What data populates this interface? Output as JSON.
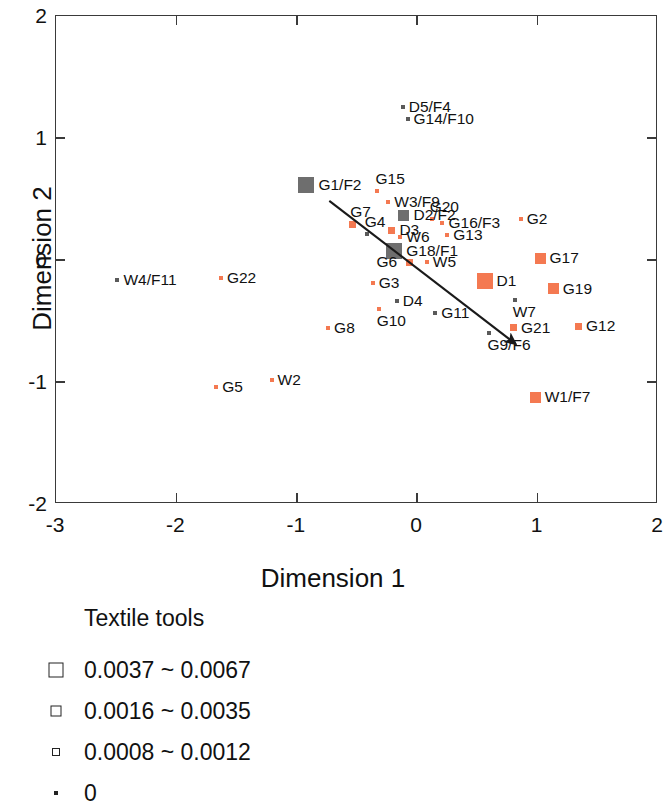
{
  "chart_data": {
    "type": "scatter",
    "title": "",
    "xlabel": "Dimension 1",
    "ylabel": "Dimension 2",
    "xlim": [
      -3,
      2
    ],
    "ylim": [
      -2,
      2
    ],
    "xticks": [
      "-3",
      "-2",
      "-1",
      "0",
      "1",
      "2"
    ],
    "xtick_values": [
      -3,
      -2,
      -1,
      0,
      1,
      2
    ],
    "yticks": [
      "2",
      "1",
      "0",
      "-1",
      "-2"
    ],
    "ytick_values": [
      2,
      1,
      0,
      -1,
      -2
    ],
    "grid": false,
    "legend_position": "below-plot-left",
    "colors": {
      "orange": "#f47951",
      "gray": "#6e6e6e",
      "dark": "#5a5a5a",
      "axis": "#3a3a3a",
      "text": "#111111"
    },
    "size_classes": {
      "large": 16,
      "medium": 11,
      "small": 7,
      "tiny": 4
    },
    "annotation": {
      "type": "arrow",
      "name": "trend-arrow",
      "x_start": -0.73,
      "y_start": 0.485,
      "x_end": 0.82,
      "y_end": -0.69
    },
    "points": [
      {
        "label": "D5/F4",
        "x": -0.12,
        "y": 1.255,
        "color": "dark",
        "size": "tiny",
        "label_side": "right"
      },
      {
        "label": "G14/F10",
        "x": -0.08,
        "y": 1.155,
        "color": "dark",
        "size": "tiny",
        "label_side": "right"
      },
      {
        "label": "G1/F2",
        "x": -0.92,
        "y": 0.615,
        "color": "gray",
        "size": "large",
        "label_side": "right"
      },
      {
        "label": "G15",
        "x": -0.33,
        "y": 0.565,
        "color": "orange",
        "size": "tiny",
        "label_side": "above-right"
      },
      {
        "label": "W3/F9",
        "x": -0.24,
        "y": 0.475,
        "color": "orange",
        "size": "tiny",
        "label_side": "right"
      },
      {
        "label": "G20",
        "x": 0.12,
        "y": 0.335,
        "color": "orange",
        "size": "tiny",
        "label_side": "above-right"
      },
      {
        "label": "D2/F2",
        "x": -0.11,
        "y": 0.365,
        "color": "gray",
        "size": "medium",
        "label_side": "right"
      },
      {
        "label": "G16/F3",
        "x": 0.21,
        "y": 0.305,
        "color": "orange",
        "size": "tiny",
        "label_side": "right"
      },
      {
        "label": "G2",
        "x": 0.86,
        "y": 0.335,
        "color": "orange",
        "size": "tiny",
        "label_side": "right"
      },
      {
        "label": "G7",
        "x": -0.54,
        "y": 0.295,
        "color": "orange",
        "size": "small",
        "label_side": "above-right"
      },
      {
        "label": "G4",
        "x": -0.42,
        "y": 0.215,
        "color": "dark",
        "size": "tiny",
        "label_side": "above-right"
      },
      {
        "label": "D3",
        "x": -0.21,
        "y": 0.245,
        "color": "orange",
        "size": "small",
        "label_side": "right"
      },
      {
        "label": "W6",
        "x": -0.14,
        "y": 0.185,
        "color": "orange",
        "size": "tiny",
        "label_side": "right"
      },
      {
        "label": "G13",
        "x": 0.25,
        "y": 0.205,
        "color": "orange",
        "size": "tiny",
        "label_side": "right"
      },
      {
        "label": "G18/F1",
        "x": -0.19,
        "y": 0.075,
        "color": "gray",
        "size": "large",
        "label_side": "right"
      },
      {
        "label": "G6",
        "x": -0.06,
        "y": -0.02,
        "color": "orange",
        "size": "small",
        "label_side": "left"
      },
      {
        "label": "W5",
        "x": 0.08,
        "y": -0.02,
        "color": "orange",
        "size": "tiny",
        "label_side": "right"
      },
      {
        "label": "G17",
        "x": 1.02,
        "y": 0.015,
        "color": "orange",
        "size": "medium",
        "label_side": "right"
      },
      {
        "label": "W4/F11",
        "x": -2.49,
        "y": -0.16,
        "color": "dark",
        "size": "tiny",
        "label_side": "right"
      },
      {
        "label": "G22",
        "x": -1.63,
        "y": -0.145,
        "color": "orange",
        "size": "tiny",
        "label_side": "right"
      },
      {
        "label": "G3",
        "x": -0.37,
        "y": -0.185,
        "color": "orange",
        "size": "tiny",
        "label_side": "right"
      },
      {
        "label": "D1",
        "x": 0.56,
        "y": -0.175,
        "color": "orange",
        "size": "large",
        "label_side": "right"
      },
      {
        "label": "G19",
        "x": 1.13,
        "y": -0.235,
        "color": "orange",
        "size": "medium",
        "label_side": "right"
      },
      {
        "label": "D4",
        "x": -0.17,
        "y": -0.34,
        "color": "dark",
        "size": "tiny",
        "label_side": "right"
      },
      {
        "label": "W7",
        "x": 0.81,
        "y": -0.33,
        "color": "dark",
        "size": "tiny",
        "label_side": "below-right"
      },
      {
        "label": "G10",
        "x": -0.32,
        "y": -0.405,
        "color": "orange",
        "size": "tiny",
        "label_side": "below-right"
      },
      {
        "label": "G11",
        "x": 0.15,
        "y": -0.435,
        "color": "dark",
        "size": "tiny",
        "label_side": "right"
      },
      {
        "label": "G21",
        "x": 0.8,
        "y": -0.555,
        "color": "orange",
        "size": "small",
        "label_side": "right"
      },
      {
        "label": "G12",
        "x": 1.34,
        "y": -0.545,
        "color": "orange",
        "size": "small",
        "label_side": "right"
      },
      {
        "label": "G8",
        "x": -0.74,
        "y": -0.555,
        "color": "orange",
        "size": "tiny",
        "label_side": "right"
      },
      {
        "label": "G9/F6",
        "x": 0.6,
        "y": -0.595,
        "color": "dark",
        "size": "tiny",
        "label_side": "below-right"
      },
      {
        "label": "G5",
        "x": -1.67,
        "y": -1.045,
        "color": "orange",
        "size": "tiny",
        "label_side": "right"
      },
      {
        "label": "W2",
        "x": -1.21,
        "y": -0.985,
        "color": "orange",
        "size": "tiny",
        "label_side": "right"
      },
      {
        "label": "W1/F7",
        "x": 0.98,
        "y": -1.125,
        "color": "orange",
        "size": "medium",
        "label_side": "right"
      }
    ]
  },
  "legend": {
    "title": "Textile tools",
    "items": [
      {
        "label": "0.0037 ~ 0.0067",
        "swatch_size": 15
      },
      {
        "label": "0.0016 ~ 0.0035",
        "swatch_size": 11
      },
      {
        "label": "0.0008 ~ 0.0012",
        "swatch_size": 8
      },
      {
        "label": "0",
        "swatch_size": 4
      }
    ]
  }
}
